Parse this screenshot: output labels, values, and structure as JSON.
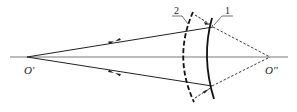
{
  "diagram": {
    "type": "optics-ray-diagram",
    "points": {
      "left_focus": {
        "label": "O'",
        "x": 27,
        "y": 57
      },
      "right_focus": {
        "label": "O''",
        "x": 270,
        "y": 57
      }
    },
    "surfaces": [
      {
        "id": "1",
        "label": "1",
        "style": "solid"
      },
      {
        "id": "2",
        "label": "2",
        "style": "dashed"
      }
    ],
    "colors": {
      "stroke": "#222222",
      "axis": "#444444",
      "background": "#ffffff"
    }
  }
}
